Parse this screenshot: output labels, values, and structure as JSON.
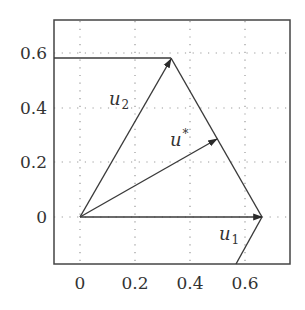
{
  "diagram": {
    "axes": {
      "x_ticks": [
        "0",
        "0.2",
        "0.4",
        "0.6"
      ],
      "y_ticks": [
        "0",
        "0.2",
        "0.4",
        "0.6"
      ],
      "xlim": [
        -0.09,
        0.77
      ],
      "ylim": [
        -0.17,
        0.72
      ],
      "grid": "dotted"
    },
    "vectors": [
      {
        "name": "u1",
        "label": "u",
        "subscript": "1",
        "from": [
          0,
          0
        ],
        "to": [
          0.667,
          0
        ]
      },
      {
        "name": "u2",
        "label": "u",
        "subscript": "2",
        "from": [
          0,
          0
        ],
        "to": [
          0.333,
          0.577
        ]
      },
      {
        "name": "u_star",
        "label": "u",
        "superscript": "*",
        "from": [
          0,
          0
        ],
        "to": [
          0.5,
          0.289
        ]
      }
    ],
    "boundary_lines": [
      {
        "name": "horizontal-line-top",
        "points": [
          [
            -0.09,
            0.577
          ],
          [
            0.333,
            0.577
          ]
        ]
      },
      {
        "name": "segment-u2-u1",
        "points": [
          [
            0.333,
            0.577
          ],
          [
            0.667,
            0
          ]
        ]
      },
      {
        "name": "segment-below-u1",
        "points": [
          [
            0.667,
            0
          ],
          [
            0.57,
            -0.17
          ]
        ]
      }
    ],
    "colors": {
      "line": "#3a3a3a",
      "grid": "#9a9a9a",
      "text": "#333333",
      "background": "#ffffff"
    }
  }
}
